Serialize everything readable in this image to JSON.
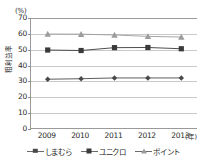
{
  "chart_data": {
    "type": "line",
    "title": "",
    "xlabel": "(年)",
    "ylabel": "粗利益率",
    "yunit": "(%)",
    "categories": [
      "2009",
      "2010",
      "2011",
      "2012",
      "2013"
    ],
    "ylim": [
      0,
      70
    ],
    "yticks": [
      0,
      10,
      20,
      30,
      40,
      50,
      60,
      70
    ],
    "grid": true,
    "legend_position": "bottom",
    "series": [
      {
        "name": "しまむら",
        "marker": "diamond",
        "color": "#4a4a4a",
        "values": [
          31.4,
          31.7,
          32.2,
          32.2,
          32.2
        ]
      },
      {
        "name": "ユニクロ",
        "marker": "square",
        "color": "#3a3a3a",
        "values": [
          49.8,
          49.5,
          51.3,
          51.4,
          50.6
        ]
      },
      {
        "name": "ポイント",
        "marker": "triangle",
        "color": "#9c9c9c",
        "values": [
          59.9,
          59.8,
          59.3,
          58.4,
          58.0
        ]
      }
    ]
  },
  "axis": {
    "y_unit_label": "(%)",
    "y_axis_title": "粗利益率",
    "x_unit_label": "(年)"
  },
  "legend": {
    "items": [
      {
        "label": "しまむら",
        "marker": "diamond-marker"
      },
      {
        "label": "ユニクロ",
        "marker": "square-marker"
      },
      {
        "label": "ポイント",
        "marker": "triangle-marker"
      }
    ]
  },
  "colors": {
    "axis": "#9a9a9a",
    "grid": "#c9c9c9",
    "text": "#2b2b2b",
    "series_shimamura": "#4a4a4a",
    "series_uniqlo": "#3a3a3a",
    "series_point": "#9c9c9c"
  }
}
